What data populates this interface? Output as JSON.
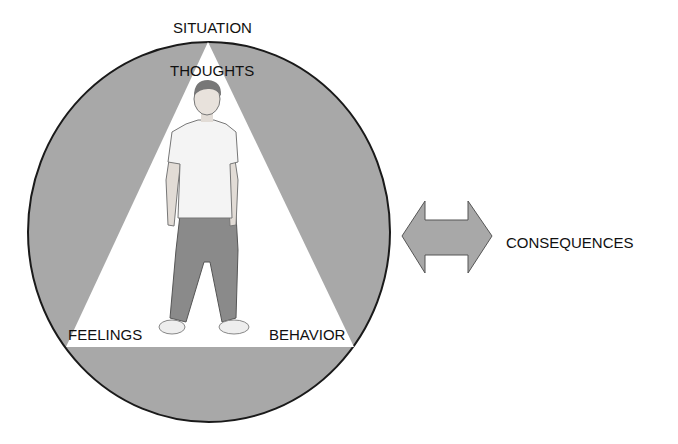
{
  "diagram": {
    "labels": {
      "situation": "SITUATION",
      "thoughts": "THOUGHTS",
      "feelings": "FEELINGS",
      "behavior": "BEHAVIOR",
      "consequences": "CONSEQUENCES"
    },
    "colors": {
      "circle_fill": "#a8a8a8",
      "circle_stroke": "#1a1a1a",
      "triangle_fill": "#ffffff",
      "arrow_fill": "#a8a8a8",
      "arrow_stroke": "#555555",
      "text": "#111111"
    }
  }
}
